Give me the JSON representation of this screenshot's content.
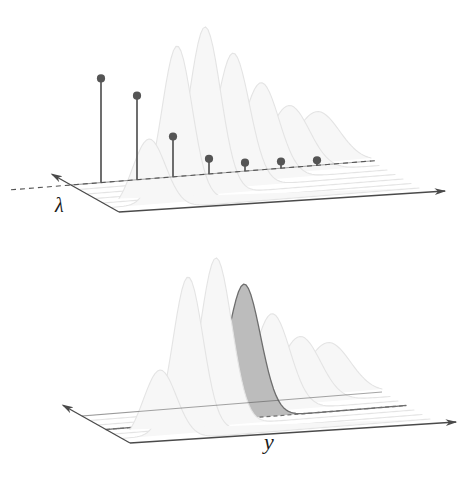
{
  "figure": {
    "title": "",
    "background_color": "#ffffff",
    "panels": [
      {
        "id": "top",
        "name": "lambda-panel",
        "axis_label": "λ",
        "axis_label_name": "lambda-axis-label",
        "description": "3D perspective surface of seven Gaussian ridges with a dashed depth line carrying seven stem markers"
      },
      {
        "id": "bottom",
        "name": "y-panel",
        "axis_label": "y",
        "axis_label_name": "y-axis-label",
        "description": "3D perspective surface of seven Gaussian ridges with the fourth ridge shaded gray and outlined"
      }
    ]
  },
  "colors": {
    "axis": "#4a4a4a",
    "curve_faint": "#e4e4e4",
    "curve_fill_faint": "#f7f7f7",
    "highlight_fill": "#bcbcbc",
    "highlight_stroke": "#6e6e6e",
    "stem": "#555555",
    "marker": "#555555",
    "dashed": "#555555",
    "label": "#1a1a1a",
    "background": "#ffffff"
  },
  "chart_data": {
    "type": "line",
    "title": "",
    "subtitle": "",
    "xlabel": "y",
    "ylabel": "",
    "zlabel": "λ",
    "grid": false,
    "legend": null,
    "projection": "3d-perspective",
    "panels": [
      {
        "id": "top",
        "axis_labels": {
          "depth": "λ",
          "horizontal": ""
        },
        "series": [
          {
            "name": "ridge-1",
            "peak_height": 0.42,
            "peak_position": 0.1,
            "width": 0.055,
            "depth_index": 0
          },
          {
            "name": "ridge-2",
            "peak_height": 0.93,
            "peak_position": 0.22,
            "width": 0.05,
            "depth_index": 1
          },
          {
            "name": "ridge-3",
            "peak_height": 1.0,
            "peak_position": 0.34,
            "width": 0.052,
            "depth_index": 2
          },
          {
            "name": "ridge-4",
            "peak_height": 0.8,
            "peak_position": 0.46,
            "width": 0.055,
            "depth_index": 3
          },
          {
            "name": "ridge-5",
            "peak_height": 0.58,
            "peak_position": 0.58,
            "width": 0.06,
            "depth_index": 4
          },
          {
            "name": "ridge-6",
            "peak_height": 0.4,
            "peak_position": 0.7,
            "width": 0.068,
            "depth_index": 5
          },
          {
            "name": "ridge-7",
            "peak_height": 0.32,
            "peak_position": 0.82,
            "width": 0.075,
            "depth_index": 6
          }
        ],
        "stems": {
          "name": "amplitude-stems",
          "count": 7,
          "values": [
            0.62,
            0.5,
            0.24,
            0.09,
            0.05,
            0.04,
            0.03
          ],
          "marker": "filled-circle",
          "baseline": "dashed"
        }
      },
      {
        "id": "bottom",
        "axis_labels": {
          "depth": "",
          "horizontal": "y"
        },
        "highlighted_index": 3,
        "series": [
          {
            "name": "ridge-1",
            "peak_height": 0.42,
            "peak_position": 0.1,
            "width": 0.055,
            "depth_index": 0,
            "highlighted": false
          },
          {
            "name": "ridge-2",
            "peak_height": 0.93,
            "peak_position": 0.22,
            "width": 0.05,
            "depth_index": 1,
            "highlighted": false
          },
          {
            "name": "ridge-3",
            "peak_height": 1.0,
            "peak_position": 0.34,
            "width": 0.052,
            "depth_index": 2,
            "highlighted": false
          },
          {
            "name": "ridge-4",
            "peak_height": 0.8,
            "peak_position": 0.46,
            "width": 0.055,
            "depth_index": 3,
            "highlighted": true
          },
          {
            "name": "ridge-5",
            "peak_height": 0.58,
            "peak_position": 0.58,
            "width": 0.06,
            "depth_index": 4,
            "highlighted": false
          },
          {
            "name": "ridge-6",
            "peak_height": 0.4,
            "peak_position": 0.7,
            "width": 0.068,
            "depth_index": 5,
            "highlighted": false
          },
          {
            "name": "ridge-7",
            "peak_height": 0.32,
            "peak_position": 0.82,
            "width": 0.075,
            "depth_index": 6,
            "highlighted": false
          }
        ]
      }
    ]
  }
}
